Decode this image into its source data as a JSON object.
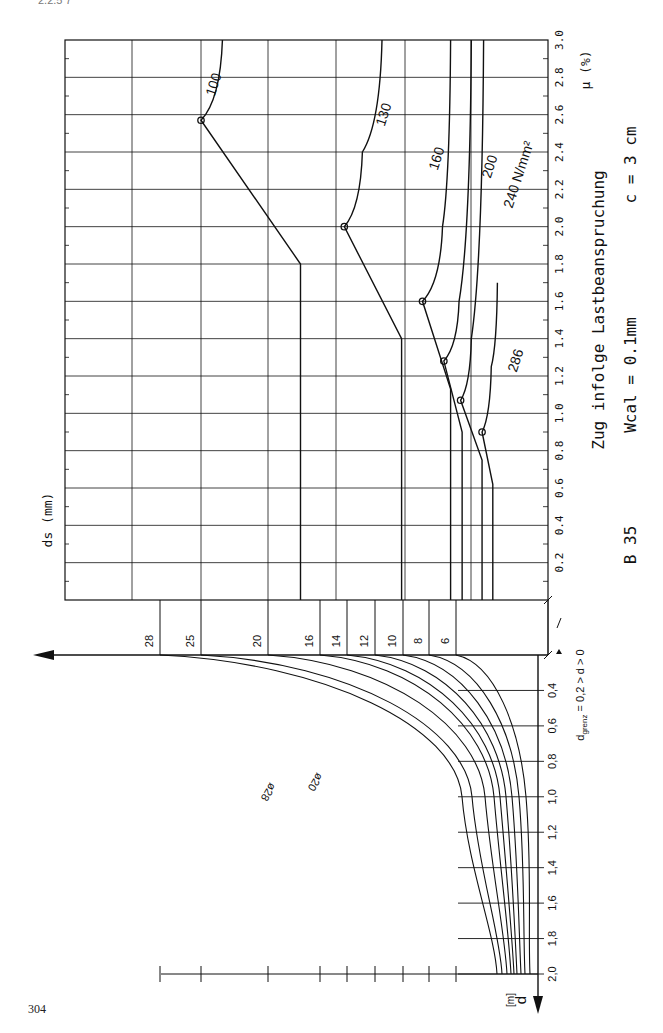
{
  "page": {
    "number": "304",
    "header_mark": "2.2.5  7"
  },
  "captions": {
    "title": "Zug infolge Lastbeanspruchung",
    "params_b": "B 35",
    "params_w": "Wcal = 0.1mm",
    "params_c": "c = 3 cm",
    "ds_axis_label": "ds (mm)",
    "mu_axis_label": "μ (%)",
    "d_axis_label": "d",
    "d_axis_unit": "[m]",
    "d_limit_note": "d",
    "d_limit_sub": "grenz",
    "d_limit_rest": " = 0,2 > d > 0",
    "phi28": "ø28",
    "phi20": "ø20",
    "stress_unit": "N/mm²"
  },
  "chart_data": [
    {
      "type": "line",
      "title": "Zug infolge Lastbeanspruchung (B 35, Wcal = 0.1mm, c = 3 cm)",
      "xlabel": "μ (%)",
      "ylabel": "ds (mm)",
      "xlim": [
        0,
        3.0
      ],
      "x_ticks": [
        "0.2",
        "0.4",
        "0.6",
        "0.8",
        "1.0",
        "1.2",
        "1.4",
        "1.6",
        "1.8",
        "2.0",
        "2.2",
        "2.4",
        "2.6",
        "2.8",
        "3.0"
      ],
      "ds_ticks": [
        28,
        25,
        20,
        16,
        14,
        12,
        10,
        8,
        6
      ],
      "grid": true,
      "series": [
        {
          "name": "100",
          "label": "100",
          "points": [
            [
              0,
              17.5
            ],
            [
              1.8,
              17.5
            ],
            [
              2.57,
              25
            ],
            [
              3.0,
              23.4
            ]
          ],
          "marker_at": [
            2.57,
            25
          ]
        },
        {
          "name": "130",
          "label": "130",
          "points": [
            [
              0,
              10.1
            ],
            [
              1.4,
              10.1
            ],
            [
              2.0,
              14.2
            ],
            [
              2.4,
              12.9
            ],
            [
              3.0,
              11.5
            ]
          ],
          "marker_at": [
            2.0,
            14.2
          ]
        },
        {
          "name": "160",
          "label": "160",
          "points": [
            [
              0,
              6.4
            ],
            [
              1.13,
              6.4
            ],
            [
              1.6,
              8.5
            ],
            [
              2.0,
              7.0
            ],
            [
              3.0,
              6.4
            ]
          ],
          "marker_at": [
            1.6,
            8.5
          ]
        },
        {
          "name": "200",
          "label": "200",
          "points": [
            [
              0,
              5.6
            ],
            [
              0.9,
              5.6
            ],
            [
              1.28,
              6.9
            ],
            [
              1.6,
              5.8
            ],
            [
              3.0,
              5.0
            ]
          ],
          "marker_at": [
            1.28,
            6.9
          ]
        },
        {
          "name": "240",
          "label": "240 N/mm²",
          "points": [
            [
              0,
              4.3
            ],
            [
              0.75,
              4.3
            ],
            [
              1.07,
              5.7
            ],
            [
              1.4,
              5.0
            ],
            [
              3.0,
              4.2
            ]
          ],
          "marker_at": [
            1.07,
            5.7
          ]
        },
        {
          "name": "286",
          "label": "286",
          "points": [
            [
              0,
              3.6
            ],
            [
              0.62,
              3.6
            ],
            [
              0.9,
              4.3
            ],
            [
              1.25,
              3.7
            ],
            [
              1.7,
              3.3
            ]
          ],
          "marker_at": [
            0.9,
            4.3
          ]
        }
      ]
    },
    {
      "type": "line",
      "title": "d-Grenzkurven",
      "xlabel": "ds (mm)",
      "ylabel": "d [m]",
      "y_ticks": [
        "0,4",
        "0,6",
        "0,8",
        "1,0",
        "1,2",
        "1,4",
        "1,6",
        "1,8",
        "2,0"
      ],
      "ylim": [
        0.2,
        2.0
      ],
      "annotation": "dgrenz = 0,2 > d > 0",
      "series_labels": [
        "ø28",
        "ø20"
      ],
      "series": [
        {
          "name": "28",
          "d0_x": 160,
          "x_at_d1": 462,
          "x_at_d2": 497
        },
        {
          "name": "25",
          "d0_x": 201,
          "x_at_d1": 472,
          "x_at_d2": 502
        },
        {
          "name": "20",
          "d0_x": 268,
          "x_at_d1": 485,
          "x_at_d2": 507
        },
        {
          "name": "16",
          "d0_x": 320,
          "x_at_d1": 494,
          "x_at_d2": 511
        },
        {
          "name": "14",
          "d0_x": 347,
          "x_at_d1": 500,
          "x_at_d2": 514
        },
        {
          "name": "12",
          "d0_x": 375,
          "x_at_d1": 506,
          "x_at_d2": 517
        },
        {
          "name": "10",
          "d0_x": 403,
          "x_at_d1": 512,
          "x_at_d2": 521
        },
        {
          "name": "8",
          "d0_x": 429,
          "x_at_d1": 519,
          "x_at_d2": 525
        },
        {
          "name": "6",
          "d0_x": 456,
          "x_at_d1": 526,
          "x_at_d2": 530
        }
      ]
    }
  ]
}
